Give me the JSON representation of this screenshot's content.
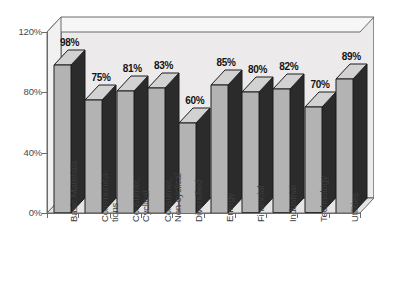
{
  "chart_data": {
    "type": "bar",
    "title": "",
    "subtitle": "",
    "xlabel": "",
    "ylabel": "",
    "ylim": [
      0,
      120
    ],
    "yticks": [
      "0%",
      "40%",
      "80%",
      "120%"
    ],
    "ytick_values": [
      0,
      40,
      80,
      120
    ],
    "grid": false,
    "legend": "none",
    "three_d": true,
    "value_suffix": "%",
    "categories": [
      "Basic Materials",
      "Communications",
      "Consumer, Cyclical",
      "Consumer, Non-cyclical",
      "Diversified",
      "Energy",
      "Financial",
      "Industrial",
      "Technology",
      "Utilities"
    ],
    "category_lines": [
      [
        "Basic Materials"
      ],
      [
        "Communica-",
        "tions"
      ],
      [
        "Consumer,",
        "Cyclical"
      ],
      [
        "Consumer,",
        "Non-cyclical"
      ],
      [
        "Diversified"
      ],
      [
        "Energy"
      ],
      [
        "Financial"
      ],
      [
        "Industrial"
      ],
      [
        "Technology"
      ],
      [
        "Utilities"
      ]
    ],
    "values": [
      98,
      75,
      81,
      83,
      60,
      85,
      80,
      82,
      70,
      89
    ],
    "data_labels": [
      "98%",
      "75%",
      "81%",
      "83%",
      "60%",
      "85%",
      "80%",
      "82%",
      "70%",
      "89%"
    ]
  },
  "style": {
    "plot_background": "#eceaea",
    "bar_front": "#b3b3b3",
    "bar_side": "#2b2b2b",
    "bar_top": "#d2d2d2",
    "axis_color": "#6b6b6b",
    "text_color": "#3d3d3d",
    "label_color": "#141414",
    "page_background": "#ffffff"
  }
}
